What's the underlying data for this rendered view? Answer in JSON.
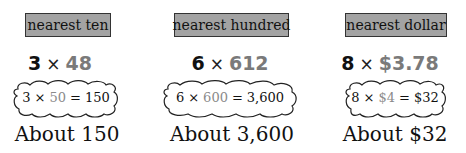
{
  "examples": [
    {
      "label": "nearest ten",
      "factor": "3",
      "times": "×",
      "number": "48",
      "estimate": {
        "factor": "3",
        "times": "×",
        "rounded": "50",
        "equals": "=",
        "result": "150"
      },
      "answer": "About 150"
    },
    {
      "label": "nearest hundred",
      "factor": "6",
      "times": "×",
      "number": "612",
      "estimate": {
        "factor": "6",
        "times": "×",
        "rounded": "600",
        "equals": "=",
        "result": "3,600"
      },
      "answer": "About 3,600"
    },
    {
      "label": "nearest dollar",
      "factor": "8",
      "times": "×",
      "number": "$3.78",
      "estimate": {
        "factor": "8",
        "times": "×",
        "rounded": "$4",
        "equals": "=",
        "result": "$32"
      },
      "answer": "About $32"
    }
  ],
  "colors": {
    "label_fill": "#a3a3a3",
    "highlight_gray": "#7a7a7a",
    "text": "#111111"
  }
}
